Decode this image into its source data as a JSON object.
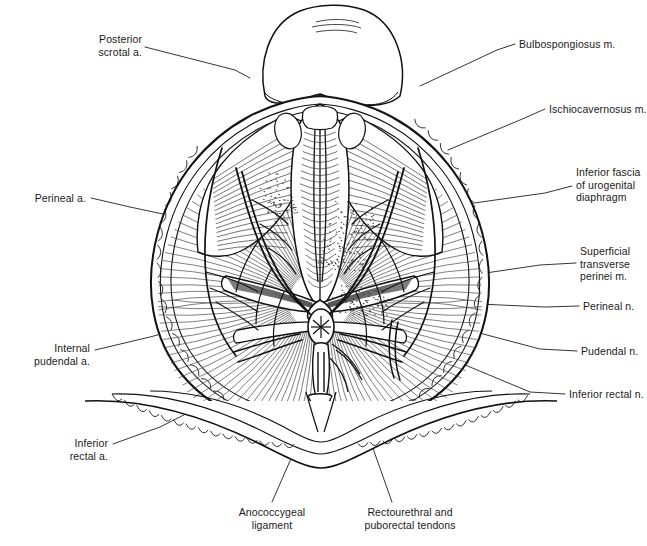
{
  "figure": {
    "view": "inferior view",
    "style": "black-and-white line engraving"
  },
  "labels": [
    {
      "id": "posterior-scrotal-a",
      "text": "Posterior\nscrotal a.",
      "side": "left",
      "x": 78,
      "y": 33,
      "w": 64,
      "leader": [
        [
          145,
          47
        ],
        [
          235,
          70
        ],
        [
          250,
          78
        ]
      ]
    },
    {
      "id": "bulbospongiosus-m",
      "text": "Bulbospongiosus m.",
      "side": "right",
      "x": 519,
      "y": 38,
      "w": 122,
      "leader": [
        [
          515,
          44
        ],
        [
          497,
          50
        ],
        [
          420,
          86
        ]
      ]
    },
    {
      "id": "ischiocavernosus-m",
      "text": "Ischiocavernosus m.",
      "side": "right",
      "x": 549,
      "y": 103,
      "w": 98,
      "leader": [
        [
          545,
          109
        ],
        [
          520,
          120
        ],
        [
          448,
          150
        ]
      ]
    },
    {
      "id": "inferior-fascia-urogenital-diaphragm",
      "text": "Inferior fascia\nof urogenital\ndiaphragm",
      "side": "right",
      "x": 576,
      "y": 166,
      "w": 71,
      "leader": [
        [
          572,
          186
        ],
        [
          545,
          193
        ],
        [
          460,
          205
        ]
      ]
    },
    {
      "id": "superficial-transverse-perinei-m",
      "text": "Superficial\ntransverse\nperinei m.",
      "side": "right",
      "x": 580,
      "y": 245,
      "w": 67,
      "leader": [
        [
          576,
          263
        ],
        [
          540,
          265
        ],
        [
          438,
          280
        ]
      ]
    },
    {
      "id": "perineal-n",
      "text": "Perineal n.",
      "side": "right",
      "x": 583,
      "y": 300,
      "w": 64,
      "leader": [
        [
          579,
          306
        ],
        [
          545,
          307
        ],
        [
          413,
          301
        ]
      ]
    },
    {
      "id": "pudendal-n",
      "text": "Pudendal n.",
      "side": "right",
      "x": 581,
      "y": 345,
      "w": 66,
      "leader": [
        [
          577,
          351
        ],
        [
          540,
          349
        ],
        [
          430,
          320
        ]
      ]
    },
    {
      "id": "inferior-rectal-n",
      "text": "Inferior rectal n.",
      "side": "right",
      "x": 569,
      "y": 388,
      "w": 78,
      "leader": [
        [
          565,
          394
        ],
        [
          530,
          392
        ],
        [
          398,
          337
        ]
      ]
    },
    {
      "id": "perineal-a",
      "text": "Perineal a.",
      "side": "left",
      "x": 23,
      "y": 192,
      "w": 63,
      "leader": [
        [
          91,
          198
        ],
        [
          130,
          207
        ],
        [
          247,
          232
        ]
      ]
    },
    {
      "id": "internal-pudendal-a",
      "text": "Internal\npudendal a.",
      "side": "left",
      "x": 26,
      "y": 342,
      "w": 64,
      "leader": [
        [
          95,
          350
        ],
        [
          150,
          337
        ],
        [
          268,
          305
        ]
      ]
    },
    {
      "id": "inferior-rectal-a",
      "text": "Inferior\nrectal a.",
      "side": "left",
      "x": 50,
      "y": 437,
      "w": 58,
      "leader": [
        [
          113,
          444
        ],
        [
          160,
          427
        ],
        [
          247,
          383
        ]
      ]
    },
    {
      "id": "anococcygeal-ligament",
      "text": "Anococcygeal\nligament",
      "side": "center",
      "x": 220,
      "y": 506,
      "w": 90,
      "leader": [
        [
          272,
          502
        ],
        [
          300,
          438
        ],
        [
          320,
          376
        ]
      ]
    },
    {
      "id": "rectourethral-puborectal-tendons",
      "text": "Rectourethral and\npuborectal tendons",
      "side": "center",
      "x": 359,
      "y": 506,
      "w": 102,
      "leader": [
        [
          392,
          502
        ],
        [
          370,
          440
        ],
        [
          348,
          370
        ]
      ]
    }
  ],
  "colors": {
    "ink": "#111111",
    "ink_light": "#4a4a4a",
    "ink_faint": "#8a8a8a",
    "paper": "#ffffff"
  },
  "structures": [
    "scrotum",
    "bulbospongiosus muscle",
    "ischiocavernosus muscle",
    "superficial transverse perinei muscle",
    "inferior fascia of urogenital diaphragm",
    "perineal body",
    "anus",
    "anococcygeal ligament",
    "gluteal fat",
    "external anal sphincter",
    "levator ani",
    "buttock skin"
  ]
}
